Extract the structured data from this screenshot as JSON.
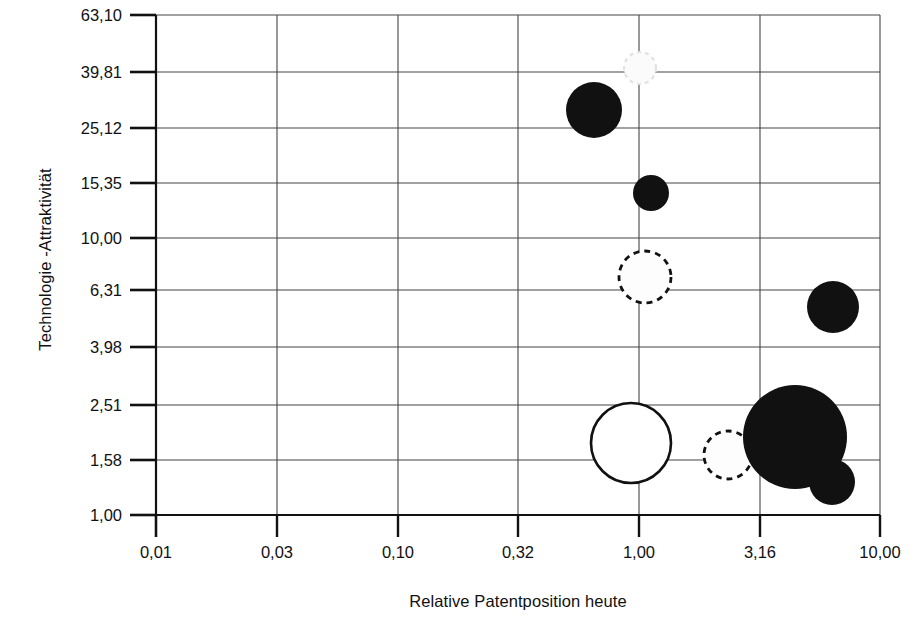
{
  "chart_data": {
    "type": "scatter",
    "title": "",
    "xlabel": "Relative Patentposition heute",
    "ylabel": "Technologie -Attraktivität",
    "xscale": "log",
    "yscale": "log",
    "grid": true,
    "legend": "none",
    "xlim": [
      0.01,
      10.0
    ],
    "ylim": [
      1.0,
      63.1
    ],
    "xticks": [
      "0,01",
      "0,03",
      "0,10",
      "0,32",
      "1,00",
      "3,16",
      "10,00"
    ],
    "xtick_values": [
      0.01,
      0.03,
      0.1,
      0.32,
      1.0,
      3.16,
      10.0
    ],
    "yticks": [
      "1,00",
      "1,58",
      "2,51",
      "3,98",
      "6,31",
      "10,00",
      "15,35",
      "25,12",
      "39,81",
      "63,10"
    ],
    "ytick_values": [
      1.0,
      1.58,
      2.51,
      3.98,
      6.31,
      10.0,
      15.35,
      25.12,
      39.81,
      63.1
    ],
    "bubbles": [
      {
        "id": "b1",
        "x": 1.0,
        "y": 38.0,
        "size": 16,
        "style": "faint",
        "label": ""
      },
      {
        "id": "b2",
        "x": 0.65,
        "y": 29.0,
        "size": 28,
        "style": "filled",
        "label": ""
      },
      {
        "id": "b3",
        "x": 1.15,
        "y": 13.8,
        "size": 18,
        "style": "filled",
        "label": ""
      },
      {
        "id": "b4",
        "x": 1.06,
        "y": 7.4,
        "size": 26,
        "style": "dashed",
        "label": ""
      },
      {
        "id": "b5",
        "x": 6.3,
        "y": 5.55,
        "size": 26,
        "style": "filled",
        "label": ""
      },
      {
        "id": "b6",
        "x": 0.9,
        "y": 1.94,
        "size": 40,
        "style": "open",
        "label": ""
      },
      {
        "id": "b7",
        "x": 2.5,
        "y": 1.72,
        "size": 24,
        "style": "dashed",
        "label": ""
      },
      {
        "id": "b8",
        "x": 4.1,
        "y": 2.05,
        "size": 52,
        "style": "filled",
        "label": ""
      },
      {
        "id": "b9",
        "x": 6.2,
        "y": 1.36,
        "size": 23,
        "style": "filled",
        "label": ""
      }
    ],
    "pixel_geometry": {
      "plot_left": 156,
      "plot_right": 880,
      "plot_top": 15,
      "plot_bottom": 515,
      "x_gridlines_px": [
        156,
        277,
        398,
        518,
        639,
        760,
        880
      ],
      "y_gridlines_px": [
        15,
        72,
        128,
        183,
        238,
        290,
        347,
        405,
        460,
        515
      ],
      "bubbles_px": [
        {
          "id": "b1",
          "cx": 640,
          "cy": 68,
          "r": 16,
          "style": "faint"
        },
        {
          "id": "b2",
          "cx": 594,
          "cy": 110,
          "r": 28,
          "style": "filled"
        },
        {
          "id": "b3",
          "cx": 651,
          "cy": 193,
          "r": 18,
          "style": "filled"
        },
        {
          "id": "b4",
          "cx": 645,
          "cy": 277,
          "r": 26,
          "style": "dashed"
        },
        {
          "id": "b5",
          "cx": 833,
          "cy": 307,
          "r": 26,
          "style": "filled"
        },
        {
          "id": "b6",
          "cx": 631,
          "cy": 443,
          "r": 40,
          "style": "open"
        },
        {
          "id": "b7",
          "cx": 728,
          "cy": 455,
          "r": 24,
          "style": "dashed"
        },
        {
          "id": "b8",
          "cx": 795,
          "cy": 437,
          "r": 52,
          "style": "filled"
        },
        {
          "id": "b9",
          "cx": 832,
          "cy": 482,
          "r": 23,
          "style": "filled"
        }
      ]
    }
  },
  "axes": {
    "y_title": "Technologie -Attraktivität",
    "x_title": "Relative Patentposition heute"
  }
}
